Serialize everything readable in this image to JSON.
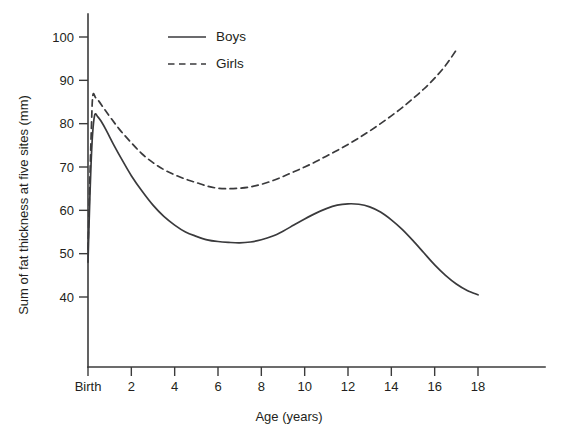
{
  "chart_data": {
    "type": "line",
    "title": "",
    "xlabel": "Age (years)",
    "ylabel": "Sum of fat thickness at five sites (mm)",
    "xlim": [
      0,
      18.6
    ],
    "ylim": [
      34,
      104
    ],
    "grid": false,
    "legend_position": "top-center",
    "x_tick_values": [
      0,
      2,
      4,
      6,
      8,
      10,
      12,
      14,
      16,
      18
    ],
    "x_tick_labels": [
      "Birth",
      "2",
      "4",
      "6",
      "8",
      "10",
      "12",
      "14",
      "16",
      "18"
    ],
    "y_tick_values": [
      40,
      50,
      60,
      70,
      80,
      90,
      100
    ],
    "y_tick_labels": [
      "40",
      "50",
      "60",
      "70",
      "80",
      "90",
      "100"
    ],
    "series": [
      {
        "name": "Boys",
        "style": "solid",
        "color": "#3a3a3c",
        "x": [
          0,
          0.08,
          0.18,
          0.3,
          0.45,
          0.6,
          0.85,
          1.2,
          1.6,
          2,
          2.5,
          3,
          3.5,
          4,
          4.5,
          5,
          5.5,
          6,
          6.5,
          7,
          7.5,
          8,
          8.5,
          9,
          9.5,
          10,
          10.5,
          11,
          11.5,
          12,
          12.5,
          13,
          13.5,
          14,
          14.5,
          15,
          15.5,
          16,
          16.5,
          17,
          17.5,
          18
        ],
        "y": [
          48,
          62,
          75,
          81.8,
          81.6,
          80.6,
          78.4,
          75,
          71.4,
          68,
          64.4,
          61.2,
          58.6,
          56.6,
          55,
          54,
          53.2,
          52.8,
          52.6,
          52.5,
          52.7,
          53.2,
          54,
          55.2,
          56.6,
          58,
          59.3,
          60.4,
          61.2,
          61.5,
          61.4,
          60.8,
          59.6,
          57.8,
          55.6,
          53,
          50.2,
          47.4,
          45,
          43,
          41.5,
          40.5
        ]
      },
      {
        "name": "Girls",
        "style": "dashed",
        "color": "#3a3a3c",
        "x": [
          0,
          0.08,
          0.15,
          0.22,
          0.35,
          0.5,
          0.75,
          1.1,
          1.5,
          2,
          2.5,
          3,
          3.5,
          4,
          4.5,
          5,
          5.5,
          6,
          6.5,
          7,
          7.5,
          8,
          8.5,
          9,
          9.5,
          10,
          10.5,
          11,
          11.5,
          12,
          12.5,
          13,
          13.5,
          14,
          14.5,
          15,
          15.5,
          16,
          16.5,
          17
        ],
        "y": [
          51,
          66,
          78,
          86.4,
          86,
          85.2,
          83.4,
          81,
          78.4,
          75.6,
          73,
          71,
          69.4,
          68.2,
          67.2,
          66.4,
          65.6,
          65.1,
          65,
          65.1,
          65.4,
          66,
          66.8,
          67.8,
          68.9,
          70,
          71.2,
          72.5,
          73.8,
          75.2,
          76.7,
          78.3,
          80,
          81.8,
          83.7,
          85.8,
          88,
          90.5,
          93.4,
          97
        ]
      }
    ],
    "legend": [
      {
        "label": "Boys",
        "style": "solid"
      },
      {
        "label": "Girls",
        "style": "dashed"
      }
    ]
  }
}
